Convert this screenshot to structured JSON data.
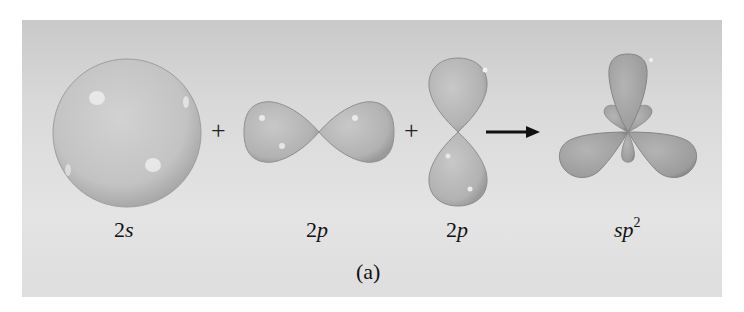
{
  "figure": {
    "caption": "(a)",
    "operators": {
      "plus1": "+",
      "plus2": "+"
    },
    "orbitals": [
      {
        "id": "2s",
        "num": "2",
        "letter": "s"
      },
      {
        "id": "2p_x",
        "num": "2",
        "letter": "p"
      },
      {
        "id": "2p_y",
        "num": "2",
        "letter": "p"
      },
      {
        "id": "sp2",
        "letter": "sp",
        "sup": "2"
      }
    ],
    "colors": {
      "background": "#d8d8d8",
      "orbital_fill": "#b9b9b9",
      "orbital_stroke": "#8e8e8e",
      "arrow": "#111111"
    }
  }
}
